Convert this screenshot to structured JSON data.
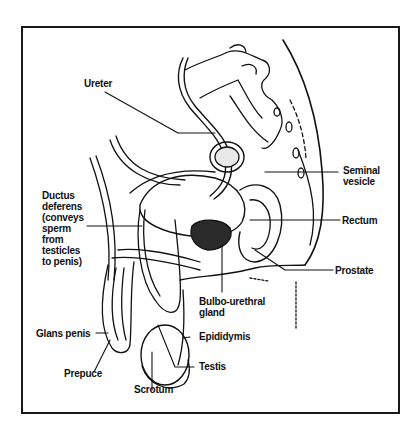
{
  "diagram": {
    "colors": {
      "ink": "#111111",
      "background": "#ffffff"
    },
    "labels": {
      "ureter": "Ureter",
      "seminal_vesicle": "Seminal\nvesicle",
      "ductus_deferens": "Ductus\ndeferens\n(conveys\nsperm\nfrom\ntesticles\nto penis)",
      "rectum": "Rectum",
      "prostate": "Prostate",
      "bulbo_urethral_gland": "Bulbo-urethral\ngland",
      "glans_penis": "Glans penis",
      "epididymis": "Epididymis",
      "prepuce": "Prepuce",
      "testis": "Testis",
      "scrotum": "Scrotum"
    }
  }
}
